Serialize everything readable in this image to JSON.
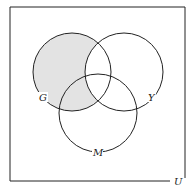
{
  "diagram": {
    "type": "venn",
    "universe_label": "U",
    "sets": [
      {
        "label": "G",
        "shaded_part": "G minus Y"
      },
      {
        "label": "Y"
      },
      {
        "label": "M"
      }
    ],
    "shaded_region": "G ∩ Yᶜ",
    "shade_color": "#e3e3e3",
    "line_color": "#222222"
  }
}
